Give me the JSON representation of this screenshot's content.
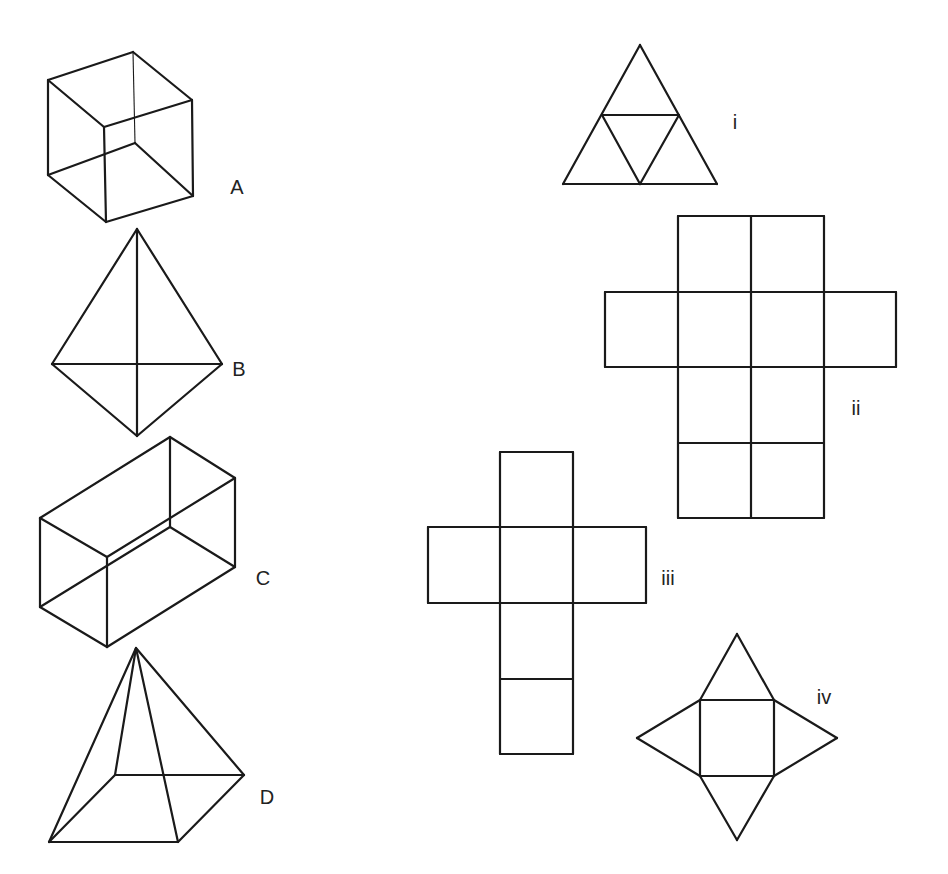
{
  "stroke_color": "#1a1a1a",
  "background": "#ffffff",
  "solids": [
    {
      "id": "A",
      "name": "cube",
      "label": "A",
      "label_pos": [
        237,
        187
      ],
      "edges": [
        [
          [
            48,
            80
          ],
          [
            133,
            52
          ]
        ],
        [
          [
            133,
            52
          ],
          [
            192,
            100
          ]
        ],
        [
          [
            192,
            100
          ],
          [
            104,
            127
          ]
        ],
        [
          [
            104,
            127
          ],
          [
            48,
            80
          ]
        ],
        [
          [
            48,
            175
          ],
          [
            106,
            222
          ]
        ],
        [
          [
            106,
            222
          ],
          [
            193,
            196
          ]
        ],
        [
          [
            48,
            80
          ],
          [
            48,
            175
          ]
        ],
        [
          [
            104,
            127
          ],
          [
            106,
            222
          ]
        ],
        [
          [
            192,
            100
          ],
          [
            193,
            196
          ]
        ],
        [
          [
            48,
            175
          ],
          [
            135,
            143
          ]
        ],
        [
          [
            135,
            143
          ],
          [
            193,
            196
          ]
        ]
      ],
      "thin_edges": [
        [
          [
            133,
            52
          ],
          [
            135,
            143
          ]
        ]
      ]
    },
    {
      "id": "B",
      "name": "triangular-bipyramid",
      "label": "B",
      "label_pos": [
        239,
        369
      ],
      "edges": [
        [
          [
            137,
            229
          ],
          [
            52,
            364
          ]
        ],
        [
          [
            137,
            229
          ],
          [
            222,
            364
          ]
        ],
        [
          [
            52,
            364
          ],
          [
            137,
            436
          ]
        ],
        [
          [
            222,
            364
          ],
          [
            137,
            436
          ]
        ],
        [
          [
            52,
            364
          ],
          [
            222,
            364
          ]
        ],
        [
          [
            137,
            229
          ],
          [
            137,
            436
          ]
        ]
      ],
      "thin_edges": []
    },
    {
      "id": "C",
      "name": "cuboid",
      "label": "C",
      "label_pos": [
        263,
        578
      ],
      "edges": [
        [
          [
            40,
            518
          ],
          [
            170,
            437
          ]
        ],
        [
          [
            170,
            437
          ],
          [
            235,
            478
          ]
        ],
        [
          [
            235,
            478
          ],
          [
            107,
            557
          ]
        ],
        [
          [
            107,
            557
          ],
          [
            40,
            518
          ]
        ],
        [
          [
            40,
            518
          ],
          [
            40,
            607
          ]
        ],
        [
          [
            107,
            557
          ],
          [
            107,
            647
          ]
        ],
        [
          [
            235,
            478
          ],
          [
            235,
            567
          ]
        ],
        [
          [
            40,
            607
          ],
          [
            107,
            647
          ]
        ],
        [
          [
            107,
            647
          ],
          [
            235,
            567
          ]
        ],
        [
          [
            40,
            607
          ],
          [
            170,
            527
          ]
        ],
        [
          [
            170,
            527
          ],
          [
            235,
            567
          ]
        ],
        [
          [
            170,
            437
          ],
          [
            170,
            527
          ]
        ]
      ],
      "thin_edges": []
    },
    {
      "id": "D",
      "name": "square-pyramid",
      "label": "D",
      "label_pos": [
        267,
        797
      ],
      "edges": [
        [
          [
            136,
            648
          ],
          [
            49,
            842
          ]
        ],
        [
          [
            136,
            648
          ],
          [
            115,
            775
          ]
        ],
        [
          [
            136,
            648
          ],
          [
            178,
            842
          ]
        ],
        [
          [
            136,
            648
          ],
          [
            244,
            775
          ]
        ],
        [
          [
            49,
            842
          ],
          [
            178,
            842
          ]
        ],
        [
          [
            178,
            842
          ],
          [
            244,
            775
          ]
        ],
        [
          [
            115,
            775
          ],
          [
            244,
            775
          ]
        ],
        [
          [
            49,
            842
          ],
          [
            115,
            775
          ]
        ]
      ],
      "thin_edges": []
    }
  ],
  "nets": [
    {
      "id": "i",
      "name": "tetrahedron-net",
      "label": "i",
      "label_pos": [
        735,
        122
      ],
      "edges": [
        [
          [
            640,
            45
          ],
          [
            563,
            184
          ]
        ],
        [
          [
            640,
            45
          ],
          [
            717,
            184
          ]
        ],
        [
          [
            563,
            184
          ],
          [
            717,
            184
          ]
        ],
        [
          [
            602,
            115
          ],
          [
            679,
            115
          ]
        ],
        [
          [
            602,
            115
          ],
          [
            640,
            184
          ]
        ],
        [
          [
            679,
            115
          ],
          [
            640,
            184
          ]
        ]
      ]
    },
    {
      "id": "ii",
      "name": "cuboid-net",
      "label": "ii",
      "label_pos": [
        856,
        408
      ],
      "edges": [
        [
          [
            678,
            216
          ],
          [
            824,
            216
          ]
        ],
        [
          [
            678,
            216
          ],
          [
            678,
            292
          ]
        ],
        [
          [
            751,
            216
          ],
          [
            751,
            518
          ]
        ],
        [
          [
            824,
            216
          ],
          [
            824,
            292
          ]
        ],
        [
          [
            605,
            292
          ],
          [
            896,
            292
          ]
        ],
        [
          [
            605,
            292
          ],
          [
            605,
            367
          ]
        ],
        [
          [
            896,
            292
          ],
          [
            896,
            367
          ]
        ],
        [
          [
            605,
            367
          ],
          [
            896,
            367
          ]
        ],
        [
          [
            678,
            292
          ],
          [
            678,
            518
          ]
        ],
        [
          [
            824,
            292
          ],
          [
            824,
            518
          ]
        ],
        [
          [
            678,
            443
          ],
          [
            824,
            443
          ]
        ],
        [
          [
            678,
            518
          ],
          [
            824,
            518
          ]
        ]
      ]
    },
    {
      "id": "iii",
      "name": "cube-net",
      "label": "iii",
      "label_pos": [
        668,
        578
      ],
      "edges": [
        [
          [
            500,
            452
          ],
          [
            573,
            452
          ]
        ],
        [
          [
            500,
            452
          ],
          [
            500,
            754
          ]
        ],
        [
          [
            573,
            452
          ],
          [
            573,
            754
          ]
        ],
        [
          [
            428,
            527
          ],
          [
            646,
            527
          ]
        ],
        [
          [
            428,
            527
          ],
          [
            428,
            603
          ]
        ],
        [
          [
            646,
            527
          ],
          [
            646,
            603
          ]
        ],
        [
          [
            428,
            603
          ],
          [
            646,
            603
          ]
        ],
        [
          [
            500,
            679
          ],
          [
            573,
            679
          ]
        ],
        [
          [
            500,
            754
          ],
          [
            573,
            754
          ]
        ]
      ]
    },
    {
      "id": "iv",
      "name": "square-pyramid-net",
      "label": "iv",
      "label_pos": [
        824,
        697
      ],
      "edges": [
        [
          [
            700,
            700
          ],
          [
            774,
            700
          ]
        ],
        [
          [
            774,
            700
          ],
          [
            774,
            776
          ]
        ],
        [
          [
            774,
            776
          ],
          [
            700,
            776
          ]
        ],
        [
          [
            700,
            776
          ],
          [
            700,
            700
          ]
        ],
        [
          [
            700,
            700
          ],
          [
            737,
            634
          ]
        ],
        [
          [
            737,
            634
          ],
          [
            774,
            700
          ]
        ],
        [
          [
            700,
            776
          ],
          [
            737,
            840
          ]
        ],
        [
          [
            737,
            840
          ],
          [
            774,
            776
          ]
        ],
        [
          [
            700,
            700
          ],
          [
            637,
            738
          ]
        ],
        [
          [
            637,
            738
          ],
          [
            700,
            776
          ]
        ],
        [
          [
            774,
            700
          ],
          [
            837,
            738
          ]
        ],
        [
          [
            837,
            738
          ],
          [
            774,
            776
          ]
        ]
      ]
    }
  ]
}
